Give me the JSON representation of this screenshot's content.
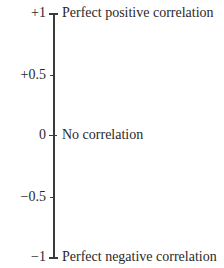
{
  "diagram": {
    "type": "correlation-scale",
    "axis": {
      "min": -1,
      "max": 1
    },
    "ticks": [
      {
        "value": 1,
        "label": "+1",
        "description": "Perfect positive correlation"
      },
      {
        "value": 0.5,
        "label": "+0.5",
        "description": ""
      },
      {
        "value": 0,
        "label": "0",
        "description": "No correlation"
      },
      {
        "value": -0.5,
        "label": "−0.5",
        "description": ""
      },
      {
        "value": -1,
        "label": "−1",
        "description": "Perfect negative correlation"
      }
    ]
  }
}
